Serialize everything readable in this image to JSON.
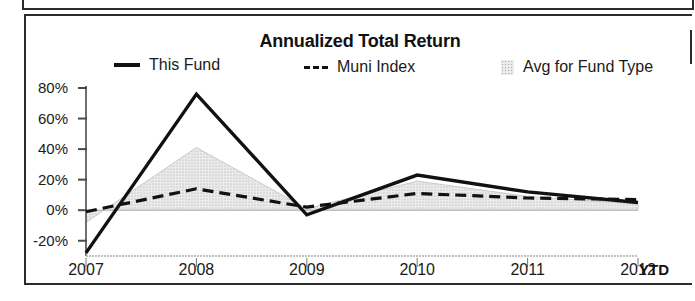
{
  "chart_data": {
    "type": "line",
    "title": "Annualized Total Return",
    "xlabel": "",
    "ylabel": "",
    "categories": [
      "2007",
      "2008",
      "2009",
      "2010",
      "2011",
      "2012"
    ],
    "x_extra_label": "YTD",
    "xticklabels": [
      "2007",
      "2008",
      "2009",
      "2010",
      "2011",
      "2012"
    ],
    "yticklabels": [
      "80%",
      "60%",
      "40%",
      "20%",
      "0%",
      "-20%"
    ],
    "ytickvalues": [
      80,
      60,
      40,
      20,
      0,
      -20
    ],
    "ylim": [
      -30,
      80
    ],
    "grid": false,
    "legend_position": "top",
    "series": [
      {
        "name": "This Fund",
        "style": "solid",
        "color": "#111111",
        "values": [
          -28,
          76,
          -3,
          23,
          12,
          5
        ]
      },
      {
        "name": "Muni Index",
        "style": "dashed",
        "color": "#111111",
        "values": [
          -1,
          14,
          2,
          11,
          8,
          7
        ]
      },
      {
        "name": "Avg for Fund Type",
        "style": "filled-area",
        "color": "#e3e3e3",
        "values": [
          -8,
          41,
          1,
          19,
          9,
          4
        ]
      }
    ]
  },
  "legend": {
    "items": [
      {
        "label": "This Fund",
        "marker": "solid-line-swatch"
      },
      {
        "label": "Muni Index",
        "marker": "dashed-line-swatch"
      },
      {
        "label": "Avg for Fund Type",
        "marker": "shaded-area-swatch"
      }
    ]
  },
  "axis": {
    "y_labels": [
      "80%",
      "60%",
      "40%",
      "20%",
      "0%",
      "-20%"
    ],
    "x_labels": [
      "2007",
      "2008",
      "2009",
      "2010",
      "2011",
      "2012"
    ],
    "ytd_label": "YTD"
  }
}
